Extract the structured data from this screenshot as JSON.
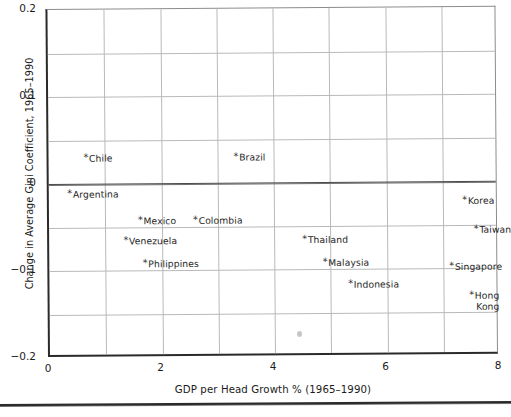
{
  "chart_data": {
    "type": "scatter",
    "title": "",
    "xlabel": "GDP per Head Growth % (1965–1990)",
    "ylabel": "Change in Average Gini Coefficient, 1965–1990",
    "xlim": [
      0,
      8
    ],
    "ylim": [
      -0.2,
      0.2
    ],
    "xticks": [
      "0",
      "2",
      "4",
      "6",
      "8"
    ],
    "xtick_values": [
      0,
      2,
      4,
      6,
      8
    ],
    "yticks": [
      "0.2",
      "0.1",
      "0",
      "−0.1",
      "−0.2"
    ],
    "ytick_values": [
      0.2,
      0.1,
      0,
      -0.1,
      -0.2
    ],
    "grid": "major gridlines every 1 unit on x and every 0.05 on y; zero line emphasized",
    "grid_x_step": 1,
    "grid_y_step": 0.05,
    "legend": "none",
    "marker": "asterisk",
    "point_label_prefix": "*",
    "colors": {
      "background": "#ffffff",
      "axis": "#2a2a2a",
      "gridline": "#b9b9b9",
      "zero_line": "#4a4a4a",
      "text": "#1b1b1b"
    },
    "points": [
      {
        "label": "Chile",
        "x": 0.62,
        "y": 0.03,
        "anchor": "left"
      },
      {
        "label": "Brazil",
        "x": 3.29,
        "y": 0.03,
        "anchor": "left"
      },
      {
        "label": "Argentina",
        "x": 0.33,
        "y": -0.012,
        "anchor": "left"
      },
      {
        "label": "Korea",
        "x": 7.35,
        "y": -0.022,
        "anchor": "left"
      },
      {
        "label": "Mexico",
        "x": 1.58,
        "y": -0.042,
        "anchor": "left"
      },
      {
        "label": "Colombia",
        "x": 2.56,
        "y": -0.042,
        "anchor": "left"
      },
      {
        "label": "Taiwan",
        "x": 7.55,
        "y": -0.055,
        "anchor": "left"
      },
      {
        "label": "Venezuela",
        "x": 1.32,
        "y": -0.065,
        "anchor": "left"
      },
      {
        "label": "Thailand",
        "x": 4.5,
        "y": -0.065,
        "anchor": "left"
      },
      {
        "label": "Philippines",
        "x": 1.66,
        "y": -0.092,
        "anchor": "left"
      },
      {
        "label": "Malaysia",
        "x": 4.86,
        "y": -0.092,
        "anchor": "left"
      },
      {
        "label": "Singapore",
        "x": 7.11,
        "y": -0.098,
        "anchor": "left"
      },
      {
        "label": "Indonesia",
        "x": 5.31,
        "y": -0.117,
        "anchor": "left"
      },
      {
        "label": "Hong Kong",
        "x": 7.25,
        "y": -0.131,
        "anchor": "left-wrap"
      }
    ]
  }
}
